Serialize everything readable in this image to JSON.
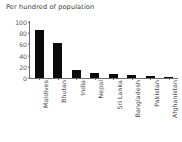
{
  "chart_data": {
    "type": "bar",
    "title": "Per hundred of population",
    "xlabel": "",
    "ylabel": "",
    "ylim": [
      0,
      100
    ],
    "yticks": [
      0,
      20,
      40,
      60,
      80,
      100
    ],
    "grid": false,
    "legend": false,
    "bar_color": "#0a0a0a",
    "categories": [
      "Maldives",
      "Bhutan",
      "India",
      "Nepal",
      "Sri Lanka",
      "Bangladesh",
      "Pakistan",
      "Afghanistan"
    ],
    "values": [
      85,
      62,
      14,
      9,
      8,
      6,
      3,
      1
    ]
  }
}
